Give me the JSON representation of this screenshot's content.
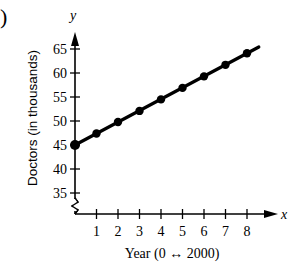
{
  "panel_label": ")",
  "chart_data": {
    "type": "line",
    "title": "",
    "xlabel": "Year (0 ↔ 2000)",
    "ylabel": "Doctors (in thousands)",
    "x_axis_symbol": "x",
    "y_axis_symbol": "y",
    "x": [
      0,
      1,
      2,
      3,
      4,
      5,
      6,
      7,
      8
    ],
    "series": [
      {
        "name": "Doctors",
        "values": [
          45,
          47.4,
          49.8,
          52.1,
          54.5,
          56.9,
          59.3,
          61.7,
          64.1
        ]
      }
    ],
    "x_ticks": [
      "1",
      "2",
      "3",
      "4",
      "5",
      "6",
      "7",
      "8"
    ],
    "y_ticks": [
      "35",
      "40",
      "45",
      "50",
      "55",
      "60",
      "65"
    ],
    "xlim": [
      0,
      8.5
    ],
    "ylim": [
      30,
      68
    ],
    "y_axis_break": true,
    "grid": false,
    "legend": "none",
    "markers": true,
    "line_color": "#000000"
  }
}
